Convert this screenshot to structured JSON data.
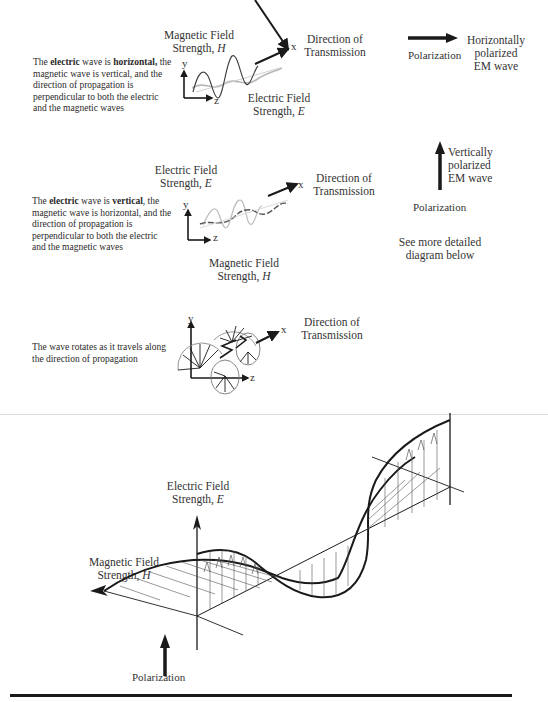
{
  "section1": {
    "description": {
      "part1": "The ",
      "bold1": "electric",
      "part2": " wave is ",
      "bold2": "horizontal,",
      "rest": "the magnetic wave is vertical, and the direction of propagation is perpendicular to both the electric and the magnetic waves"
    },
    "magnetic_label_line1": "Magnetic Field",
    "magnetic_label_line2": "Strength, ",
    "magnetic_symbol": "H",
    "electric_label_line1": "Electric Field",
    "electric_label_line2": "Strength, ",
    "electric_symbol": "E",
    "direction_line1": "Direction of",
    "direction_line2": "Transmission",
    "axis_y": "y",
    "axis_z": "z",
    "axis_x": "x",
    "polarization_label": "Polarization",
    "polarized_line1": "Horizontally",
    "polarized_line2": "polarized",
    "polarized_line3": "EM wave"
  },
  "section2": {
    "description": {
      "part1": "The ",
      "bold1": "electric",
      "part2": " wave is ",
      "bold2": "vertical",
      "part3": ",",
      "rest": "the magnetic wave is horizontal, and the direction of propagation is perpendicular to both the electric and the magnetic waves"
    },
    "electric_label_line1": "Electric Field",
    "electric_label_line2": "Strength, ",
    "electric_symbol": "E",
    "magnetic_label_line1": "Magnetic Field",
    "magnetic_label_line2": "Strength, ",
    "magnetic_symbol": "H",
    "direction_line1": "Direction of",
    "direction_line2": "Transmission",
    "axis_y": "y",
    "axis_z": "z",
    "axis_x": "x",
    "polarized_line1": "Vertically",
    "polarized_line2": "polarized",
    "polarized_line3": "EM wave",
    "polarization_label": "Polarization",
    "see_more_line1": "See more detailed",
    "see_more_line2": "diagram below"
  },
  "section3": {
    "description_line1": "The wave rotates as it travels along",
    "description_line2": "the direction of propagation",
    "direction_line1": "Direction of",
    "direction_line2": "Transmission",
    "axis_y": "y",
    "axis_z": "z",
    "axis_x": "x"
  },
  "detail": {
    "electric_label_line1": "Electric Field",
    "electric_label_line2": "Strength, ",
    "electric_symbol": "E",
    "magnetic_label_line1": "Magnetic Field",
    "magnetic_label_line2": "Strength, ",
    "magnetic_symbol": "H",
    "polarization_label": "Polarization"
  },
  "colors": {
    "ink": "#1a1a1a",
    "text": "#333333",
    "light_wave": "#b8b8b8",
    "separator": "#dcdcdc"
  }
}
